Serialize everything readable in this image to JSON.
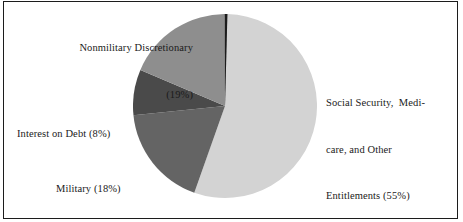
{
  "figure": {
    "background_color": "#ffffff",
    "border_color": "#1c1c1c",
    "text_color": "#1a1a1a"
  },
  "labels": {
    "nonmilitary": {
      "line1": "Nonmilitary Discretionary",
      "line2": "(19%)"
    },
    "interest": {
      "line1": "Interest on Debt (8%)"
    },
    "military": {
      "line1": "Military (18%)"
    },
    "social": {
      "line1": "Social Security,  Medi-",
      "line2": "care, and Other",
      "line3": "Entitlements (55%)"
    }
  },
  "chart_data": {
    "type": "pie",
    "title": "",
    "subtitle": "",
    "xlabel": "",
    "ylabel": "",
    "legend_position": "none",
    "labels_position": "outside-callout",
    "grid": false,
    "units": "percent of federal budget",
    "total": 100,
    "start_angle_deg": 0,
    "direction": "clockwise",
    "center_px": [
      225,
      106
    ],
    "radius_px": 92,
    "slices": [
      {
        "name": "Social Security, Medicare, and Other Entitlements",
        "label": "Social Security,  Medi-care, and Other Entitlements (55%)",
        "value": 55,
        "percent": "55%",
        "color": "#d3d3d3",
        "start_angle_deg": 1.5,
        "end_angle_deg": 199.5
      },
      {
        "name": "Military",
        "label": "Military (18%)",
        "value": 18,
        "percent": "18%",
        "color": "#646464",
        "start_angle_deg": 199.5,
        "end_angle_deg": 264.3
      },
      {
        "name": "Interest on Debt",
        "label": "Interest on Debt (8%)",
        "value": 8,
        "percent": "8%",
        "color": "#4a4a4a",
        "start_angle_deg": 264.3,
        "end_angle_deg": 293.1
      },
      {
        "name": "Nonmilitary Discretionary",
        "label": "Nonmilitary Discretionary (19%)",
        "value": 19,
        "percent": "19%",
        "color": "#8e8e8e",
        "start_angle_deg": 293.1,
        "end_angle_deg": 361.5
      },
      {
        "name": "separator-sliver",
        "label": "",
        "value": 0.4,
        "percent": "",
        "color": "#1c1c1c",
        "start_angle_deg": 359.9,
        "end_angle_deg": 1.5
      }
    ]
  }
}
